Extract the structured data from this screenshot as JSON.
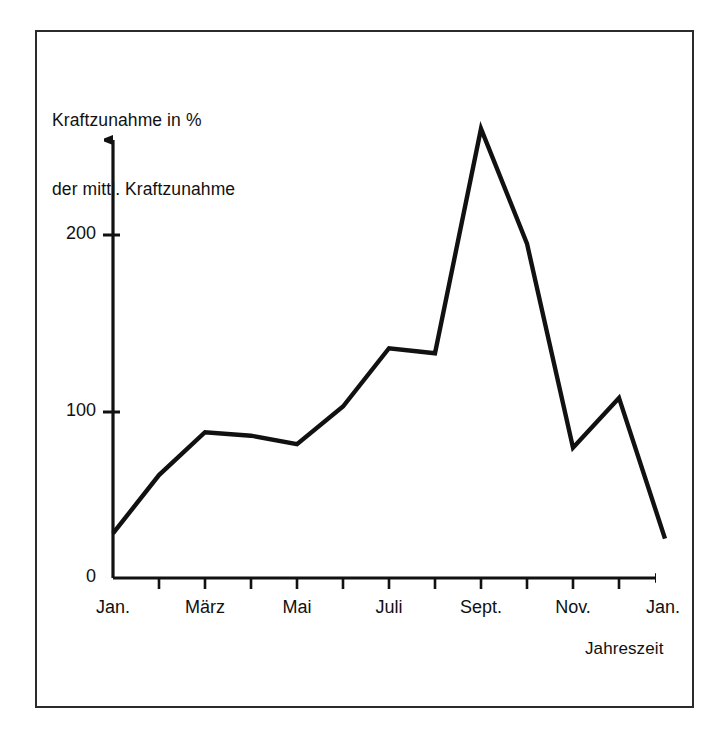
{
  "figure": {
    "border_color": "#2b2b2b",
    "background": "#ffffff",
    "line_color": "#111111"
  },
  "chart_data": {
    "type": "line",
    "title": "",
    "ylabel": "Kraftzunahme in %\nder mittl. Kraftzunahme",
    "ylabel_line1": "Kraftzunahme in %",
    "ylabel_line2": "der mittl. Kraftzunahme",
    "xlabel": "Jahreszeit",
    "ylim": [
      0,
      275
    ],
    "yticks": [
      0,
      100,
      200
    ],
    "ytick_labels": [
      "0",
      "100",
      "200"
    ],
    "xtick_labels": [
      "Jan.",
      "März",
      "Mai",
      "Juli",
      "Sept.",
      "Nov.",
      "Jan."
    ],
    "x": [
      "Jan.",
      "Feb.",
      "März",
      "April",
      "Mai",
      "Juni",
      "Juli",
      "Aug.",
      "Sept.",
      "Okt.",
      "Nov.",
      "Dez.",
      "Jan."
    ],
    "values": [
      26,
      60,
      85,
      83,
      78,
      100,
      134,
      131,
      262,
      195,
      76,
      105,
      23
    ],
    "grid": false,
    "legend": false,
    "axis_arrows": true,
    "series": [
      {
        "name": "Kraftzunahme",
        "values": [
          26,
          60,
          85,
          83,
          78,
          100,
          134,
          131,
          262,
          195,
          76,
          105,
          23
        ]
      }
    ]
  }
}
